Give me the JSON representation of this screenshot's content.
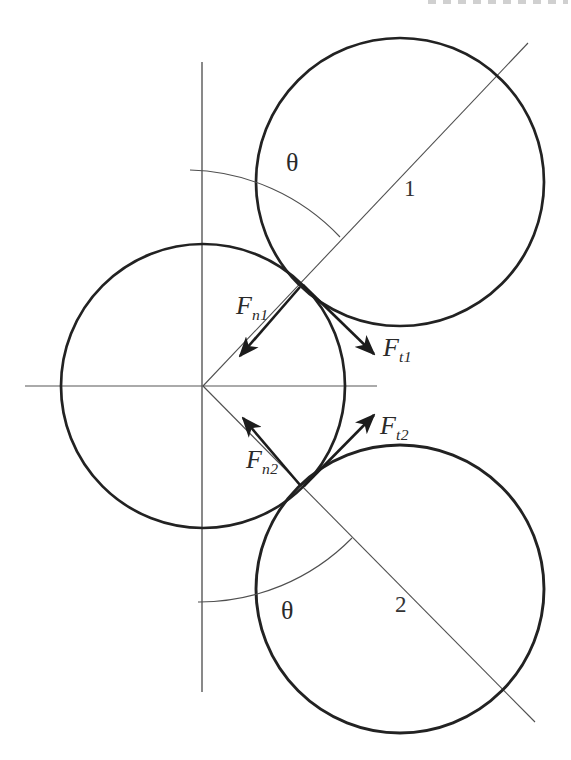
{
  "figure": {
    "type": "physics-contact-force-diagram",
    "theta": "θ",
    "sphere1_label": "1",
    "sphere2_label": "2",
    "forces": {
      "fn1": {
        "symbol": "F",
        "subscript": "n1"
      },
      "ft1": {
        "symbol": "F",
        "subscript": "t1"
      },
      "fn2": {
        "symbol": "F",
        "subscript": "n2"
      },
      "ft2": {
        "symbol": "F",
        "subscript": "t2"
      }
    },
    "colors": {
      "background": "#ffffff",
      "circle_stroke": "#222222",
      "thin_line": "#4f4f4f",
      "axis_line": "#4a4a4a",
      "arrow": "#1c1c1c",
      "label_text": "#2a2a2a",
      "header_artifact": "#b8b8b8"
    },
    "geometry": {
      "central_circle": {
        "cx": 203,
        "cy": 386,
        "r": 142
      },
      "circle_1": {
        "cx": 400,
        "cy": 182,
        "r": 144
      },
      "circle_2": {
        "cx": 400,
        "cy": 589,
        "r": 144
      },
      "contact_point_1": {
        "x": 302,
        "y": 284
      },
      "contact_point_2": {
        "x": 302,
        "y": 487
      },
      "theta_angle_deg": 45
    }
  }
}
